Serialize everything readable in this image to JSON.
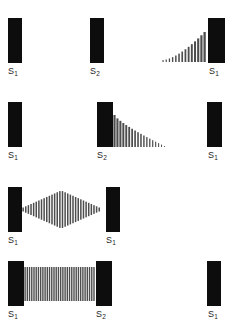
{
  "figure": {
    "colors": {
      "mirror": "#0d0d0d",
      "wave": "#4d4d4d",
      "background": "#ffffff",
      "label_text": "#262626"
    },
    "columns": 3,
    "rows": 4
  },
  "labels": {
    "s1": "S",
    "s1_sub": "1",
    "s2": "S",
    "s2_sub": "2"
  },
  "rows": [
    {
      "index": 1,
      "name": "row-1-wave-approaching",
      "cells": [
        {
          "name": "cell-1-1",
          "mirror": true,
          "label": "S",
          "sub": "1",
          "wave": "none"
        },
        {
          "name": "cell-1-2",
          "mirror": true,
          "label": "S",
          "sub": "2",
          "wave": "none"
        },
        {
          "name": "cell-1-3",
          "mirror": true,
          "label": "S",
          "sub": "1",
          "wave": "increasing-left-of-mirror"
        }
      ]
    },
    {
      "index": 2,
      "name": "row-2-wave-departing",
      "cells": [
        {
          "name": "cell-2-1",
          "mirror": true,
          "label": "S",
          "sub": "1",
          "wave": "none"
        },
        {
          "name": "cell-2-2",
          "mirror": true,
          "label": "S",
          "sub": "2",
          "wave": "decreasing-right-of-mirror"
        },
        {
          "name": "cell-2-3",
          "mirror": true,
          "label": "S",
          "sub": "1",
          "wave": "none"
        }
      ]
    },
    {
      "index": 3,
      "name": "row-3-standing-wave-diamond",
      "cells": [
        {
          "name": "cell-3-1",
          "mirror": true,
          "label": "S",
          "sub": "1",
          "wave": "diamond-envelope-between-mirrors"
        },
        {
          "name": "cell-3-2",
          "mirror": true,
          "label": "S",
          "sub": "1",
          "wave": "none"
        },
        {
          "name": "cell-3-3",
          "mirror": false,
          "label": "",
          "sub": "",
          "wave": "none"
        }
      ]
    },
    {
      "index": 4,
      "name": "row-4-uniform-standing-wave",
      "cells": [
        {
          "name": "cell-4-1",
          "mirror": true,
          "label": "S",
          "sub": "1",
          "wave": "uniform-between-mirrors"
        },
        {
          "name": "cell-4-2",
          "mirror": true,
          "label": "S",
          "sub": "2",
          "wave": "none"
        },
        {
          "name": "cell-4-3",
          "mirror": true,
          "label": "S",
          "sub": "1",
          "wave": "none"
        }
      ]
    }
  ],
  "wave_data": {
    "increasing": {
      "count": 14,
      "min_height": 2,
      "max_height": 30,
      "align": "bottom"
    },
    "decreasing": {
      "count": 18,
      "min_height": 1,
      "max_height": 32,
      "align": "bottom"
    },
    "diamond": {
      "count": 30,
      "min_height": 4,
      "max_height": 38,
      "align": "center"
    },
    "uniform": {
      "count": 32,
      "height": 34,
      "align": "center"
    }
  }
}
